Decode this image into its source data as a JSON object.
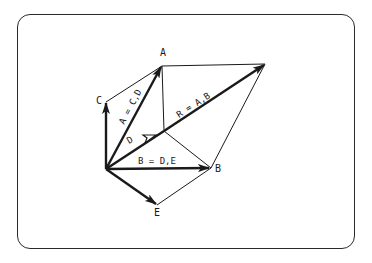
{
  "diagram": {
    "type": "vector-addition",
    "origin": {
      "x": 106,
      "y": 169
    },
    "points": {
      "A": {
        "label": "A",
        "x": 162,
        "y": 66,
        "lx": 163,
        "ly": 55
      },
      "B": {
        "label": "B",
        "x": 211,
        "y": 168,
        "lx": 216,
        "ly": 172
      },
      "C": {
        "label": "C",
        "x": 106,
        "y": 102,
        "lx": 97,
        "ly": 103
      },
      "D": {
        "label": "D",
        "x": 164,
        "y": 131
      },
      "E": {
        "label": "E",
        "x": 157,
        "y": 205,
        "lx": 155,
        "ly": 216
      },
      "R": {
        "label": "R",
        "x": 265,
        "y": 64
      }
    },
    "vector_labels": {
      "A": "A = C,D",
      "B": "B = D,E",
      "R": "R = A,B",
      "D": "D"
    },
    "colors": {
      "stroke": "#1a1a1a",
      "frame": "#2a2a2a",
      "background": "#ffffff"
    }
  }
}
